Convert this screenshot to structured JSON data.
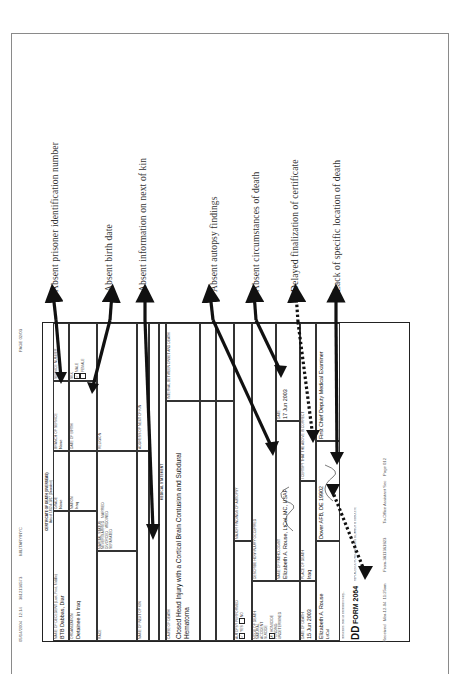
{
  "annotations": [
    {
      "id": "prisoner-id",
      "label": "Absent prisoner identification number"
    },
    {
      "id": "birth-date",
      "label": "Absent birth date"
    },
    {
      "id": "next-of-kin",
      "label": "Absent information on next of kin"
    },
    {
      "id": "autopsy",
      "label": "Absent autopsy findings"
    },
    {
      "id": "circumstances",
      "label": "Absent circumstances of death"
    },
    {
      "id": "finalization",
      "label": "Delayed finalization of certificate"
    },
    {
      "id": "location",
      "label": "Lack of specific location of death"
    }
  ],
  "fax_header": {
    "date": "05/14/2004",
    "time": "12:14",
    "number": "3812136573",
    "sender": "MILITARY/NYC",
    "page": "PAGE 02/03"
  },
  "form": {
    "title_line1": "CERTIFICATE OF DEATH (OVERSEAS)",
    "title_line2": "Acts of 1812 & 1817 (Decedent)",
    "name_label": "NAME OF DECEDENT (Last, First, Middle)",
    "name_value": "BTB Dabbas, Diar",
    "grade_label": "GRADE",
    "grade_value": "None",
    "branch_label": "BRANCH OF SERVICE",
    "branch_value": "None",
    "service_no_label": "SERVICE NUMBER",
    "service_no_value": "",
    "organization_label": "ORGANIZATION",
    "organization_value": "Detainee in Iraq",
    "nation_label": "NATION",
    "nation_value": "Iraq",
    "birth_label": "DATE OF BIRTH",
    "birth_value": "",
    "sex_label": "SEX",
    "sex_male": "MALE",
    "sex_female": "FEMALE",
    "race_label": "RACE",
    "marital_label": "MARITAL STATUS",
    "marital_options": [
      "NEVER MARRIED",
      "MARRIED",
      "DIVORCED",
      "WIDOWED",
      "SEPARATED"
    ],
    "religion_label": "RELIGION",
    "kin_label": "NAME OF NEXT OF KIN",
    "kin_value": "",
    "kin_address_label": "ADDRESS OF NEXT OF KIN",
    "kin_address_value": "",
    "medical_statement": "MEDICAL STATEMENT",
    "cause_label": "CAUSE OF DEATH",
    "cause_value": "Closed Head Injury with a Cortical Brain Contusion and Subdural Hematoma",
    "interval_label": "INTERVAL BETWEEN ONSET AND DEATH",
    "interval_value": "",
    "autopsy_label": "AUTOPSY PERFORMED",
    "autopsy_yes": "YES",
    "autopsy_no": "NO",
    "autopsy_findings_label": "MAJOR FINDINGS OF AUTOPSY",
    "autopsy_findings_value": "",
    "mode_label": "MODE OF DEATH",
    "mode_options": [
      "NATURAL",
      "ACCIDENT",
      "SUICIDE",
      "HOMICIDE",
      "PENDING",
      "UNDETERMINED"
    ],
    "mode_checked": "HOMICIDE",
    "circumstances_label": "DESCRIBE HOW INJURY OCCURRED",
    "circumstances_value": "",
    "date_death_label": "DATE OF DEATH",
    "date_death_value": "15 Jun 2003",
    "place_label": "PLACE OF DEATH",
    "place_value": "Iraq",
    "physician_label": "NAME OF PATHOLOGIST",
    "physician_value": "Elizabeth A. Rouse, LtCol, MC, USAF",
    "signature_date_label": "DATE",
    "signature_date_value": "17 Jun 2003",
    "certify_label": "I CERTIFY THAT THE ABOVE IS CORRECT",
    "certifier_name": "Elizabeth A. Rouse",
    "certifier_grade": "LtCol",
    "certifier_title": "First Chief Deputy Medical Examiner",
    "certifier_address": "Dover AFB, DE 19902",
    "form_number": "DD",
    "form_code": "FORM 2064",
    "form_edition": "REPLACES DD FORM 2064, 1 AUG 85, WHICH IS OBSOLETE",
    "instructions": "Instructions: State all information clearly..."
  },
  "fax_footer": {
    "received": "Received",
    "received_date": "Mar-12-04",
    "received_time": "11:25am",
    "from": "From-3811361823",
    "to": "To-Office Assistant Sec",
    "page": "Page 012"
  }
}
